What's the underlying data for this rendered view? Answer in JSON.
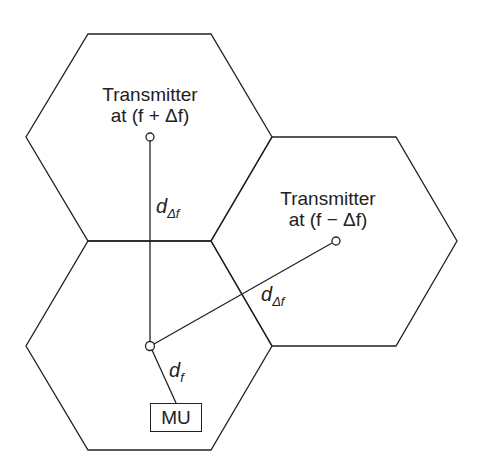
{
  "diagram": {
    "type": "cellular-hexagon-layout",
    "cells": [
      {
        "id": "cell-top",
        "points": "88,34 211,34 272,137 211,241 88,241 26,137"
      },
      {
        "id": "cell-right",
        "points": "272,137 396,137 457,241 396,346 272,346 211,241"
      },
      {
        "id": "cell-bottom",
        "points": "88,241 211,241 272,346 211,450 88,450 26,346"
      }
    ],
    "nodes": {
      "transmitter_plus": {
        "line1": "Transmitter",
        "line2": "at (f + Δf)",
        "x": 150,
        "y": 137
      },
      "transmitter_minus": {
        "line1": "Transmitter",
        "line2": "at (f − Δf)",
        "x": 336,
        "y": 241
      },
      "receiver": {
        "x": 150,
        "y": 346
      },
      "mu": {
        "label": "MU"
      }
    },
    "edges": [
      {
        "from": "transmitter_plus",
        "to": "receiver",
        "label": "d",
        "sub": "Δf"
      },
      {
        "from": "transmitter_minus",
        "to": "receiver",
        "label": "d",
        "sub": "Δf"
      },
      {
        "from": "receiver",
        "to": "mu",
        "label": "d",
        "sub": "f"
      }
    ],
    "stroke_color": "#222222"
  }
}
